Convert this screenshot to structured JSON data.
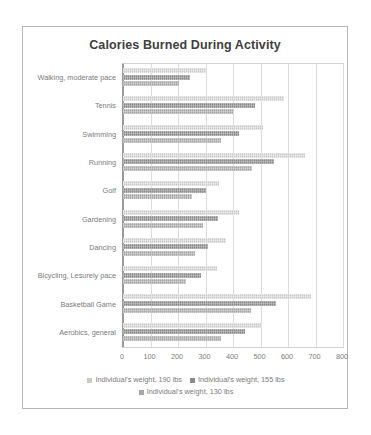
{
  "chart_data": {
    "type": "bar",
    "title": "Calories Burned During Activity",
    "xlabel": "",
    "ylabel": "",
    "orientation": "horizontal",
    "grid": true,
    "legend_position": "bottom",
    "xlim": [
      0,
      800
    ],
    "xticks": [
      0,
      100,
      200,
      300,
      400,
      500,
      600,
      700,
      800
    ],
    "categories": [
      "Walking, moderate pace",
      "Tennis",
      "Swimming",
      "Running",
      "Golf",
      "Gardening",
      "Dancing",
      "Bicycling, Lesurely pace",
      "Basketball Game",
      "Aerobics, general"
    ],
    "series": [
      {
        "name": "Individual's weight, 190 lbs",
        "color": "#c9c9c9",
        "values": [
          300,
          585,
          510,
          660,
          350,
          420,
          375,
          340,
          685,
          505
        ]
      },
      {
        "name": "Individual's weight, 155 lbs",
        "color": "#8a8a8a",
        "values": [
          245,
          480,
          420,
          550,
          300,
          345,
          310,
          285,
          555,
          445
        ]
      },
      {
        "name": "Individual's weight, 130 lbs",
        "color": "#a5a5a5",
        "values": [
          205,
          400,
          355,
          470,
          250,
          290,
          260,
          230,
          465,
          355
        ]
      }
    ]
  }
}
